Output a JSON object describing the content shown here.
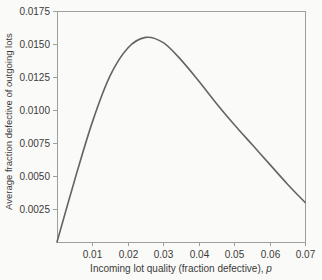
{
  "figure": {
    "background": "#fafaf8",
    "text_color": "#3a3a3a",
    "axis_color": "#9e9e9e",
    "curve_color": "#646464"
  },
  "chart_data": {
    "type": "line",
    "title": "",
    "xlabel_main": "Incoming lot quality (fraction defective), ",
    "xlabel_var": "p",
    "ylabel": "Average fraction defective of outgoing lots",
    "xlim": [
      0,
      0.07
    ],
    "ylim": [
      0,
      0.0175
    ],
    "grid": false,
    "legend_position": "none",
    "x_ticks": [
      {
        "value": 0.01,
        "label": "0.01"
      },
      {
        "value": 0.02,
        "label": "0.02"
      },
      {
        "value": 0.03,
        "label": "0.03"
      },
      {
        "value": 0.04,
        "label": "0.04"
      },
      {
        "value": 0.05,
        "label": "0.05"
      },
      {
        "value": 0.06,
        "label": "0.06"
      },
      {
        "value": 0.07,
        "label": "0.07"
      }
    ],
    "y_ticks": [
      {
        "value": 0.0025,
        "label": "0.0025"
      },
      {
        "value": 0.005,
        "label": "0.0050"
      },
      {
        "value": 0.0075,
        "label": "0.0075"
      },
      {
        "value": 0.01,
        "label": "0.0100"
      },
      {
        "value": 0.0125,
        "label": "0.0125"
      },
      {
        "value": 0.015,
        "label": "0.0150"
      },
      {
        "value": 0.0175,
        "label": "0.0175"
      }
    ],
    "series": [
      {
        "name": "average-outgoing-quality-curve",
        "peak": {
          "p": 0.0255,
          "aoq": 0.0155
        },
        "x": [
          0.0,
          0.005,
          0.01,
          0.015,
          0.02,
          0.025,
          0.03,
          0.035,
          0.04,
          0.045,
          0.05,
          0.055,
          0.06,
          0.065,
          0.07
        ],
        "y": [
          0.0,
          0.0047,
          0.0091,
          0.0126,
          0.0147,
          0.0155,
          0.0151,
          0.0138,
          0.0122,
          0.0105,
          0.0089,
          0.0074,
          0.0059,
          0.0044,
          0.003
        ]
      }
    ]
  }
}
